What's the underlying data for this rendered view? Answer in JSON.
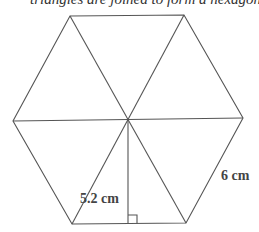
{
  "caption": "triangles are joined to form a hexagon",
  "diagram": {
    "shape": "regular hexagon divided into 6 equilateral triangles",
    "line_color": "#555555",
    "labels": {
      "height": "5.2 cm",
      "side": "6 cm"
    },
    "right_angle_marker": true
  }
}
